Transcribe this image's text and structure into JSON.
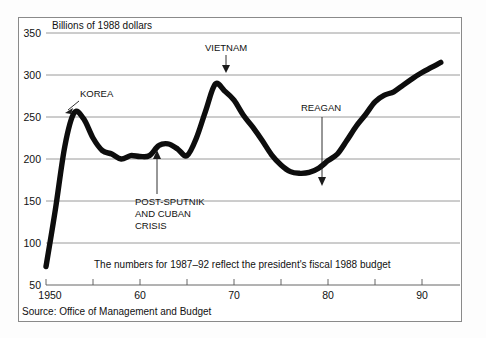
{
  "figure": {
    "axis_title": "Billions of 1988 dollars",
    "note": "The numbers for 1987–92 reflect the president's fiscal 1988 budget",
    "source": "Source: Office of Management and Budget",
    "line_color": "#0d0d0d",
    "grid_color": "#8f8f8f",
    "frame_color": "#8a8a8a",
    "background": "#ffffff"
  },
  "chart_data": {
    "type": "line",
    "title": "Billions of 1988 dollars",
    "xlabel": "",
    "ylabel": "Billions of 1988 dollars",
    "xlim": [
      1950,
      1992
    ],
    "ylim": [
      50,
      350
    ],
    "ytick_values": [
      50,
      100,
      150,
      200,
      250,
      300,
      350
    ],
    "ytick_labels": [
      "50",
      "100",
      "150",
      "200",
      "250",
      "300",
      "350"
    ],
    "xtick_values": [
      1950,
      1955,
      1960,
      1965,
      1970,
      1975,
      1980,
      1985,
      1990
    ],
    "xtick_labels": [
      "1950",
      "",
      "60",
      "",
      "70",
      "",
      "80",
      "",
      "90"
    ],
    "grid": "horizontal",
    "legend": "none",
    "series": [
      {
        "name": "U.S. defense spending",
        "x": [
          1950,
          1951,
          1952,
          1953,
          1954,
          1955,
          1956,
          1957,
          1958,
          1959,
          1960,
          1961,
          1962,
          1963,
          1964,
          1965,
          1966,
          1967,
          1968,
          1969,
          1970,
          1971,
          1972,
          1973,
          1974,
          1975,
          1976,
          1977,
          1978,
          1979,
          1980,
          1981,
          1982,
          1983,
          1984,
          1985,
          1986,
          1987,
          1988,
          1989,
          1990,
          1991,
          1992
        ],
        "values": [
          72,
          140,
          215,
          255,
          248,
          225,
          210,
          206,
          200,
          204,
          203,
          204,
          216,
          218,
          212,
          204,
          225,
          258,
          289,
          281,
          270,
          252,
          238,
          222,
          205,
          193,
          185,
          183,
          184,
          189,
          198,
          206,
          222,
          239,
          253,
          268,
          276,
          280,
          288,
          296,
          303,
          309,
          315
        ]
      }
    ],
    "annotations": [
      {
        "label": "KOREA",
        "x": 1953,
        "y": 255
      },
      {
        "label": "VIETNAM",
        "x": 1968,
        "y": 289
      },
      {
        "label": "POST-SPUTNIK AND CUBAN CRISIS",
        "x": 1962,
        "y": 216
      },
      {
        "label": "REAGAN",
        "x": 1979.5,
        "y": 189
      }
    ],
    "annotation_lines": {
      "korea": [
        "KOREA"
      ],
      "vietnam": [
        "VIETNAM"
      ],
      "post_sputnik": [
        "POST-SPUTNIK",
        "AND CUBAN",
        "CRISIS"
      ],
      "reagan": [
        "REAGAN"
      ]
    }
  }
}
